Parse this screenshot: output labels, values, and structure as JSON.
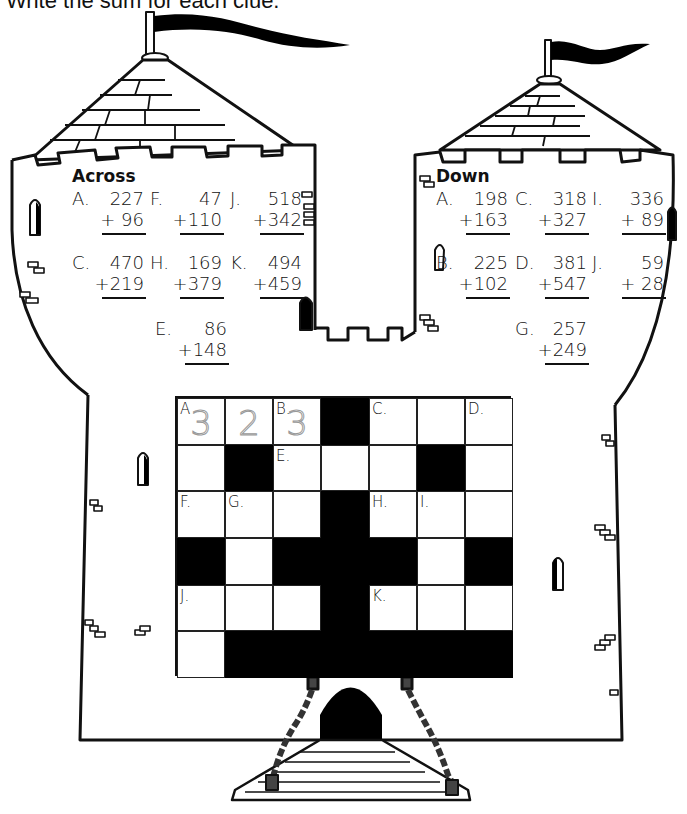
{
  "instructions": "Write the sum for each clue.",
  "across": {
    "heading": "Across",
    "clues": [
      {
        "label": "A.",
        "top": "227",
        "bottom": "+ 96",
        "x": 72,
        "y": 188
      },
      {
        "label": "F.",
        "top": "47",
        "bottom": "+110",
        "x": 150,
        "y": 188
      },
      {
        "label": "J.",
        "top": "518",
        "bottom": "+342",
        "x": 230,
        "y": 188
      },
      {
        "label": "C.",
        "top": "470",
        "bottom": "+219",
        "x": 72,
        "y": 252
      },
      {
        "label": "H.",
        "top": "169",
        "bottom": "+379",
        "x": 150,
        "y": 252
      },
      {
        "label": "K.",
        "top": "494",
        "bottom": "+459",
        "x": 230,
        "y": 252
      },
      {
        "label": "E.",
        "top": "86",
        "bottom": "+148",
        "x": 155,
        "y": 318
      }
    ]
  },
  "down": {
    "heading": "Down",
    "clues": [
      {
        "label": "A.",
        "top": "198",
        "bottom": "+163",
        "x": 436,
        "y": 188
      },
      {
        "label": "C.",
        "top": "318",
        "bottom": "+327",
        "x": 515,
        "y": 188
      },
      {
        "label": "I.",
        "top": "336",
        "bottom": "+ 89",
        "x": 592,
        "y": 188
      },
      {
        "label": "B.",
        "top": "225",
        "bottom": "+102",
        "x": 436,
        "y": 252
      },
      {
        "label": "D.",
        "top": "381",
        "bottom": "+547",
        "x": 515,
        "y": 252
      },
      {
        "label": "J.",
        "top": "59",
        "bottom": "+ 28",
        "x": 592,
        "y": 252
      },
      {
        "label": "G.",
        "top": "257",
        "bottom": "+249",
        "x": 515,
        "y": 318
      }
    ]
  },
  "grid": {
    "columns": 7,
    "rows": 6,
    "cells": [
      [
        {
          "num": "A",
          "trace": "3"
        },
        {
          "trace": "2"
        },
        {
          "num": "B.",
          "trace": "3"
        },
        {
          "black": true
        },
        {
          "num": "C."
        },
        {},
        {
          "num": "D."
        }
      ],
      [
        {},
        {
          "black": true
        },
        {
          "num": "E."
        },
        {},
        {},
        {
          "black": true
        },
        {}
      ],
      [
        {
          "num": "F."
        },
        {
          "num": "G."
        },
        {},
        {
          "black": true
        },
        {
          "num": "H."
        },
        {
          "num": "I."
        },
        {}
      ],
      [
        {
          "black": true
        },
        {},
        {
          "black": true
        },
        {
          "black": true
        },
        {
          "black": true
        },
        {},
        {
          "black": true
        }
      ],
      [
        {
          "num": "J."
        },
        {},
        {},
        {
          "black": true
        },
        {
          "num": "K."
        },
        {},
        {}
      ],
      [
        {},
        {
          "black": true
        },
        {
          "black": true
        },
        {
          "black": true
        },
        {
          "black": true
        },
        {
          "black": true
        },
        {
          "black": true
        }
      ]
    ]
  },
  "colors": {
    "ink": "#111111",
    "paper": "#ffffff",
    "trace": "#999999"
  }
}
